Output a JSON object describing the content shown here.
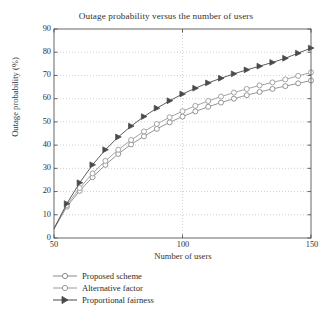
{
  "chart_data": {
    "type": "line",
    "title": "Outage probability versus the number of users",
    "xlabel": "Number of users",
    "ylabel": "Outage probability (%)",
    "xlim": [
      50,
      150
    ],
    "ylim": [
      0,
      90
    ],
    "xticks": [
      50,
      100,
      150
    ],
    "yticks": [
      0,
      10,
      20,
      30,
      40,
      50,
      60,
      70,
      80,
      90
    ],
    "grid": true,
    "grid_style": "dotted",
    "legend_position": "below-axes-left",
    "x": [
      50,
      55,
      60,
      65,
      70,
      75,
      80,
      85,
      90,
      95,
      100,
      105,
      110,
      115,
      120,
      125,
      130,
      135,
      140,
      145,
      150
    ],
    "series": [
      {
        "name": "Proposed scheme",
        "marker": "circle-open",
        "color": "#8a8a8a",
        "values": [
          4,
          13.5,
          20.3,
          26.2,
          31.5,
          36.2,
          40.3,
          43.8,
          47.0,
          49.8,
          52.3,
          54.5,
          56.5,
          58.3,
          60.0,
          61.5,
          62.9,
          64.2,
          65.4,
          66.6,
          67.8
        ]
      },
      {
        "name": "Alternative factor",
        "marker": "circle-open",
        "color": "#9a9a9a",
        "values": [
          4,
          14.2,
          21.5,
          27.8,
          33.2,
          38.0,
          42.2,
          45.9,
          49.1,
          52.0,
          54.6,
          56.9,
          59.0,
          60.9,
          62.6,
          64.2,
          65.7,
          67.0,
          68.3,
          69.8,
          71.3
        ]
      },
      {
        "name": "Proportional fairness",
        "marker": "triangle-right-filled",
        "color": "#4a4a4a",
        "values": [
          4,
          14.8,
          23.8,
          31.5,
          38.0,
          43.5,
          48.2,
          52.3,
          55.9,
          59.1,
          62.0,
          64.5,
          66.8,
          68.8,
          70.7,
          72.4,
          74.0,
          75.6,
          77.4,
          79.6,
          81.8
        ]
      }
    ]
  },
  "axis": {
    "ytick_labels": [
      "90",
      "80",
      "70",
      "60",
      "50",
      "40",
      "30",
      "20",
      "10",
      "0"
    ],
    "xtick_labels": [
      "50",
      "100",
      "150"
    ]
  }
}
